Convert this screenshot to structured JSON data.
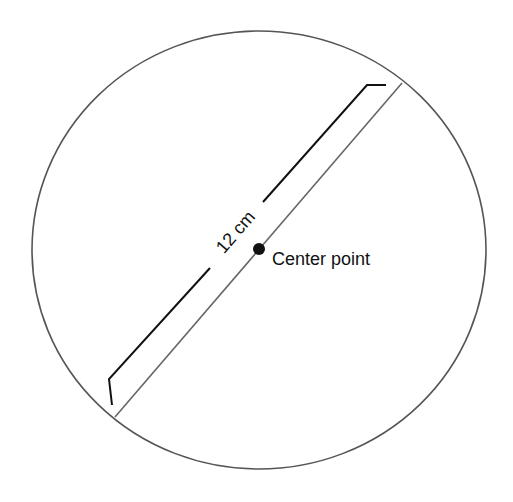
{
  "diagram": {
    "type": "circle-diameter",
    "diameter_label": "12 cm",
    "center_label": "Center point",
    "colors": {
      "circle_stroke": "#555555",
      "bracket_stroke": "#111111",
      "dot_fill": "#111111",
      "background": "#ffffff"
    }
  }
}
